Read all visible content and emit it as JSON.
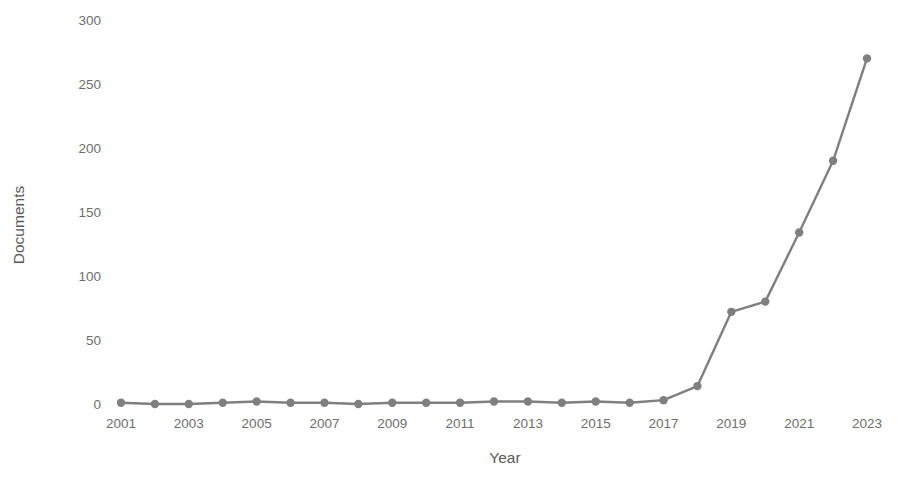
{
  "chart_data": {
    "type": "line",
    "title": "",
    "xlabel": "Year",
    "ylabel": "Documents",
    "x": [
      2001,
      2002,
      2003,
      2004,
      2005,
      2006,
      2007,
      2008,
      2009,
      2010,
      2011,
      2012,
      2013,
      2014,
      2015,
      2016,
      2017,
      2018,
      2019,
      2020,
      2021,
      2022,
      2023
    ],
    "values": [
      1,
      0,
      0,
      1,
      2,
      1,
      1,
      0,
      1,
      1,
      1,
      2,
      2,
      1,
      2,
      1,
      3,
      14,
      72,
      80,
      134,
      190,
      270
    ],
    "series": [
      {
        "name": "Documents",
        "values": [
          1,
          0,
          0,
          1,
          2,
          1,
          1,
          0,
          1,
          1,
          1,
          2,
          2,
          1,
          2,
          1,
          3,
          14,
          72,
          80,
          134,
          190,
          270
        ]
      }
    ],
    "xlim": [
      2001,
      2023
    ],
    "ylim": [
      0,
      300
    ],
    "y_ticks": [
      0,
      50,
      100,
      150,
      200,
      250,
      300
    ],
    "x_ticks": [
      2001,
      2003,
      2005,
      2007,
      2009,
      2011,
      2013,
      2015,
      2017,
      2019,
      2021,
      2023
    ],
    "y_tick_labels": [
      "0",
      "50",
      "100",
      "150",
      "200",
      "250",
      "300"
    ],
    "x_tick_labels": [
      "2001",
      "2003",
      "2005",
      "2007",
      "2009",
      "2011",
      "2013",
      "2015",
      "2017",
      "2019",
      "2021",
      "2023"
    ],
    "grid": false,
    "legend": "none",
    "marker": "circle",
    "colors": {
      "line": "#7f7f7f",
      "marker": "#7f7f7f",
      "background": "#ffffff",
      "tick_text": "#6e6e6e",
      "axis_title_text": "#595959"
    }
  }
}
